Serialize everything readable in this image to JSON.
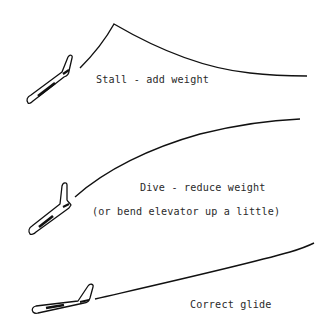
{
  "diagram": {
    "panels": [
      {
        "id": "stall",
        "label": "Stall - add weight",
        "flight_path": "climbs steeply, peaks, then drops"
      },
      {
        "id": "dive",
        "label": "Dive - reduce weight",
        "sublabel": "(or bend elevator up a little)",
        "flight_path": "curves downward steeply"
      },
      {
        "id": "glide",
        "label": "Correct glide",
        "flight_path": "long shallow straight glide"
      }
    ],
    "colors": {
      "line": "#111111",
      "text": "#2a2a2a",
      "background": "#ffffff"
    }
  }
}
